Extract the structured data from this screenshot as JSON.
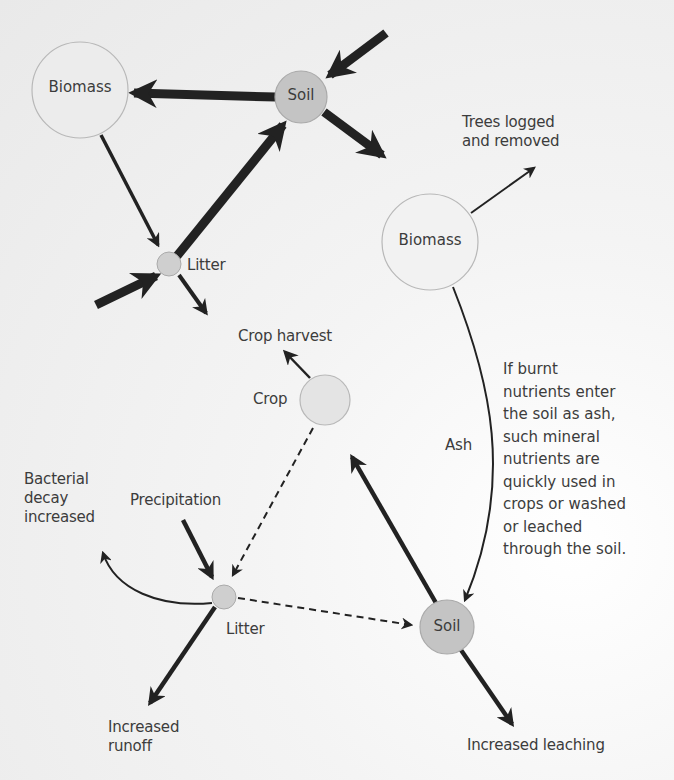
{
  "diagram": {
    "title": "",
    "before": {
      "nodes": {
        "biomass": {
          "label": "Biomass"
        },
        "soil": {
          "label": "Soil"
        },
        "litter": {
          "label": "Litter"
        }
      }
    },
    "after": {
      "nodes": {
        "biomass": {
          "label": "Biomass"
        },
        "crop": {
          "label": "Crop"
        },
        "litter": {
          "label": "Litter"
        },
        "soil": {
          "label": "Soil"
        }
      },
      "labels": {
        "trees_logged": [
          "Trees logged",
          "and removed"
        ],
        "crop_harvest": "Crop harvest",
        "ash": "Ash",
        "precipitation": "Precipitation",
        "bacterial_decay": [
          "Bacterial",
          "decay",
          "increased"
        ],
        "increased_runoff": [
          "Increased",
          "runoff"
        ],
        "increased_leaching": "Increased leaching"
      },
      "note": [
        "If burnt",
        "nutrients enter",
        "the soil as ash,",
        "such mineral",
        "nutrients are",
        "quickly used in",
        "crops or washed",
        "or leached",
        "through the soil."
      ]
    },
    "colors": {
      "arrow": "#222222",
      "node_light": "#ececec",
      "node_soil": "#c4c4c4",
      "node_small": "#cfcfcf",
      "node_stroke": "#b0b0b0",
      "text": "#3c3c3c"
    }
  }
}
